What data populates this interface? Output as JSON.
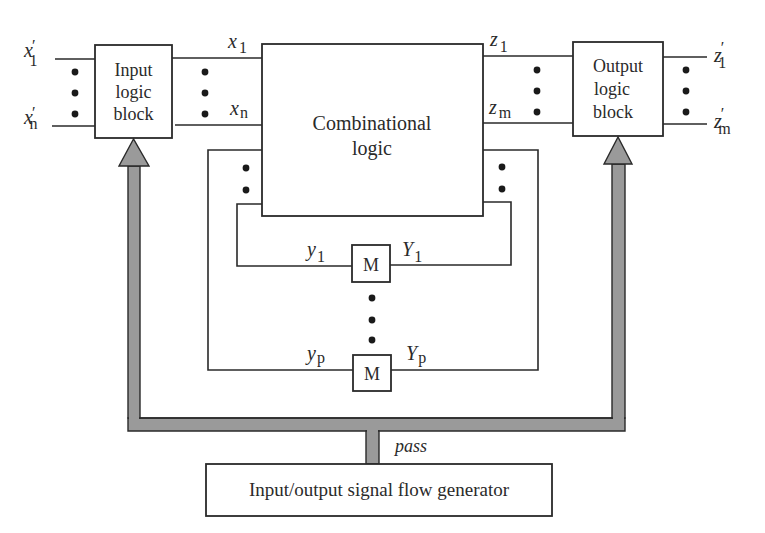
{
  "diagram": {
    "type": "block-diagram",
    "blocks": {
      "input_logic": {
        "line1": "Input",
        "line2": "logic",
        "line3": "block"
      },
      "output_logic": {
        "line1": "Output",
        "line2": "logic",
        "line3": "block"
      },
      "combinational": {
        "line1": "Combinational",
        "line2": "logic"
      },
      "memory_1": {
        "label": "M"
      },
      "memory_p": {
        "label": "M"
      },
      "generator": {
        "label": "Input/output signal flow generator"
      }
    },
    "signals": {
      "x1_prime": {
        "base": "x",
        "prime": "′",
        "sub": "1"
      },
      "xn_prime": {
        "base": "x",
        "prime": "′",
        "sub": "n"
      },
      "x1": {
        "base": "x",
        "sub": "1"
      },
      "xn": {
        "base": "x",
        "sub": "n"
      },
      "z1": {
        "base": "z",
        "sub": "1"
      },
      "zm": {
        "base": "z",
        "sub": "m"
      },
      "z1_prime": {
        "base": "z",
        "prime": "′",
        "sub": "1"
      },
      "zm_prime": {
        "base": "z",
        "prime": "′",
        "sub": "m"
      },
      "y1": {
        "base": "y",
        "sub": "1"
      },
      "Y1": {
        "base": "Y",
        "sub": "1"
      },
      "yp": {
        "base": "y",
        "sub": "p"
      },
      "Yp": {
        "base": "Y",
        "sub": "p"
      },
      "pass": {
        "label": "pass"
      }
    },
    "colors": {
      "line": "#2a2a2a",
      "bus_fill": "#9a9a9a",
      "background": "#ffffff"
    }
  }
}
